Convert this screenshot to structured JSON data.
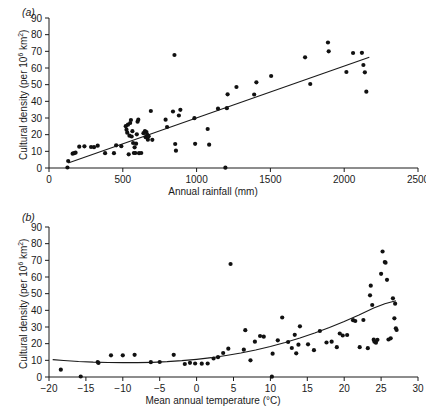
{
  "figure": {
    "panels": [
      {
        "label": "(a)",
        "xlabel": "Annual rainfall (mm)",
        "ylabel_prefix": "Cultural density (per 10",
        "ylabel_exp": "6",
        "ylabel_suffix": " km",
        "ylabel_suffix2": "2",
        "ylabel_close": ")"
      },
      {
        "label": "(b)",
        "xlabel": "Mean annual temperature (°C)",
        "ylabel_prefix": "Cultural density (per 10",
        "ylabel_exp": "6",
        "ylabel_suffix": " km",
        "ylabel_suffix2": "2",
        "ylabel_close": ")"
      }
    ]
  },
  "chart_data": [
    {
      "type": "scatter",
      "panel": "(a)",
      "title": "",
      "xlabel": "Annual rainfall (mm)",
      "ylabel": "Cultural density (per 10^6 km^2)",
      "xlim": [
        0,
        2500
      ],
      "ylim": [
        0,
        90
      ],
      "xticks": [
        0,
        500,
        1000,
        1500,
        2000,
        2500
      ],
      "yticks": [
        0,
        10,
        20,
        30,
        40,
        50,
        60,
        70,
        80,
        90
      ],
      "grid": false,
      "legend": "none",
      "marker": "filled-circle",
      "marker_color": "#111111",
      "fit": {
        "kind": "linear",
        "color": "#1a1a1a",
        "x_start": 130,
        "y_start": 3.0,
        "x_end": 2170,
        "y_end": 66.5
      },
      "points": [
        [
          125,
          0.3
        ],
        [
          130,
          4.2
        ],
        [
          160,
          8.6
        ],
        [
          170,
          8.9
        ],
        [
          180,
          9.2
        ],
        [
          205,
          12.8
        ],
        [
          240,
          13.0
        ],
        [
          285,
          12.6
        ],
        [
          305,
          12.5
        ],
        [
          330,
          13.4
        ],
        [
          380,
          8.9
        ],
        [
          440,
          8.9
        ],
        [
          455,
          13.6
        ],
        [
          490,
          13.1
        ],
        [
          520,
          25.1
        ],
        [
          525,
          23.0
        ],
        [
          530,
          21.2
        ],
        [
          535,
          26.0
        ],
        [
          540,
          8.2
        ],
        [
          545,
          19.4
        ],
        [
          550,
          27.0
        ],
        [
          555,
          28.8
        ],
        [
          560,
          18.9
        ],
        [
          565,
          22.1
        ],
        [
          570,
          15.0
        ],
        [
          575,
          9.0
        ],
        [
          580,
          12.4
        ],
        [
          585,
          9.0
        ],
        [
          590,
          14.6
        ],
        [
          595,
          20.2
        ],
        [
          600,
          27.8
        ],
        [
          605,
          29.0
        ],
        [
          610,
          8.9
        ],
        [
          625,
          9.0
        ],
        [
          640,
          20.9
        ],
        [
          650,
          22.2
        ],
        [
          655,
          18.5
        ],
        [
          660,
          21.6
        ],
        [
          665,
          20.0
        ],
        [
          670,
          17.0
        ],
        [
          675,
          19.0
        ],
        [
          690,
          34.2
        ],
        [
          700,
          16.9
        ],
        [
          790,
          29.0
        ],
        [
          800,
          24.6
        ],
        [
          840,
          33.9
        ],
        [
          850,
          67.8
        ],
        [
          855,
          14.4
        ],
        [
          860,
          10.4
        ],
        [
          880,
          31.5
        ],
        [
          890,
          34.9
        ],
        [
          985,
          29.9
        ],
        [
          990,
          14.5
        ],
        [
          1075,
          23.4
        ],
        [
          1085,
          14.0
        ],
        [
          1145,
          35.6
        ],
        [
          1195,
          0.2
        ],
        [
          1205,
          35.9
        ],
        [
          1210,
          44.2
        ],
        [
          1270,
          48.6
        ],
        [
          1390,
          44.1
        ],
        [
          1405,
          51.4
        ],
        [
          1505,
          55.2
        ],
        [
          1735,
          66.4
        ],
        [
          1770,
          50.4
        ],
        [
          1890,
          75.3
        ],
        [
          1895,
          70.0
        ],
        [
          2015,
          57.6
        ],
        [
          2060,
          69.0
        ],
        [
          2120,
          69.1
        ],
        [
          2130,
          61.8
        ],
        [
          2140,
          57.4
        ],
        [
          2150,
          45.8
        ]
      ]
    },
    {
      "type": "scatter",
      "panel": "(b)",
      "title": "",
      "xlabel": "Mean annual temperature (°C)",
      "ylabel": "Cultural density (per 10^6 km^2)",
      "xlim": [
        -20,
        30
      ],
      "ylim": [
        0,
        90
      ],
      "xticks": [
        -20,
        -15,
        -10,
        -5,
        0,
        5,
        10,
        15,
        20,
        25,
        30
      ],
      "yticks": [
        0,
        10,
        20,
        30,
        40,
        50,
        60,
        70,
        80,
        90
      ],
      "grid": false,
      "legend": "none",
      "marker": "filled-circle",
      "marker_color": "#111111",
      "fit": {
        "kind": "exponential-curve",
        "color": "#1a1a1a",
        "points": [
          [
            -19.5,
            10.4
          ],
          [
            -18,
            9.9
          ],
          [
            -16,
            9.3
          ],
          [
            -14,
            8.9
          ],
          [
            -12,
            8.7
          ],
          [
            -10,
            8.6
          ],
          [
            -8,
            8.6
          ],
          [
            -6,
            8.8
          ],
          [
            -4,
            9.2
          ],
          [
            -2,
            9.8
          ],
          [
            0,
            10.6
          ],
          [
            2,
            11.6
          ],
          [
            4,
            12.9
          ],
          [
            6,
            14.4
          ],
          [
            8,
            16.2
          ],
          [
            10,
            18.3
          ],
          [
            12,
            20.7
          ],
          [
            14,
            23.4
          ],
          [
            16,
            26.4
          ],
          [
            18,
            29.7
          ],
          [
            20,
            33.3
          ],
          [
            22,
            37.2
          ],
          [
            24,
            41.4
          ],
          [
            25.5,
            44.0
          ],
          [
            27,
            45.7
          ]
        ]
      },
      "points": [
        [
          -18.4,
          4.4
        ],
        [
          -15.7,
          0.3
        ],
        [
          -13.4,
          9.0
        ],
        [
          -13.3,
          8.4
        ],
        [
          -11.6,
          13.0
        ],
        [
          -10.0,
          13.0
        ],
        [
          -8.4,
          13.3
        ],
        [
          -6.2,
          8.9
        ],
        [
          -5.0,
          9.0
        ],
        [
          -3.1,
          13.3
        ],
        [
          -1.6,
          7.8
        ],
        [
          -0.9,
          8.5
        ],
        [
          -0.2,
          8.1
        ],
        [
          0.7,
          8.0
        ],
        [
          1.5,
          8.1
        ],
        [
          2.3,
          11.1
        ],
        [
          2.9,
          11.9
        ],
        [
          3.6,
          14.4
        ],
        [
          4.3,
          17.0
        ],
        [
          4.6,
          67.8
        ],
        [
          6.4,
          16.4
        ],
        [
          6.6,
          28.1
        ],
        [
          7.3,
          10.0
        ],
        [
          7.9,
          21.2
        ],
        [
          8.6,
          24.6
        ],
        [
          9.1,
          24.2
        ],
        [
          10.2,
          0.2
        ],
        [
          10.3,
          14.0
        ],
        [
          11.0,
          22.0
        ],
        [
          11.6,
          35.7
        ],
        [
          12.4,
          21.0
        ],
        [
          12.9,
          17.4
        ],
        [
          13.3,
          25.3
        ],
        [
          13.5,
          14.2
        ],
        [
          13.8,
          19.4
        ],
        [
          14.0,
          30.4
        ],
        [
          15.1,
          19.6
        ],
        [
          15.9,
          16.1
        ],
        [
          16.7,
          27.6
        ],
        [
          17.6,
          20.7
        ],
        [
          18.3,
          21.2
        ],
        [
          19.0,
          17.9
        ],
        [
          19.4,
          26.1
        ],
        [
          19.8,
          24.9
        ],
        [
          20.4,
          25.2
        ],
        [
          21.2,
          34.1
        ],
        [
          21.5,
          33.6
        ],
        [
          22.1,
          17.9
        ],
        [
          22.6,
          34.2
        ],
        [
          23.2,
          17.3
        ],
        [
          23.5,
          49.0
        ],
        [
          23.6,
          54.8
        ],
        [
          23.8,
          43.2
        ],
        [
          24.0,
          22.4
        ],
        [
          24.1,
          21.2
        ],
        [
          24.3,
          20.6
        ],
        [
          24.5,
          22.3
        ],
        [
          25.0,
          61.9
        ],
        [
          25.2,
          75.3
        ],
        [
          25.5,
          69.0
        ],
        [
          25.6,
          68.6
        ],
        [
          25.8,
          58.3
        ],
        [
          26.0,
          22.5
        ],
        [
          26.3,
          23.2
        ],
        [
          26.6,
          47.2
        ],
        [
          26.8,
          35.2
        ],
        [
          26.9,
          44.0
        ],
        [
          27.0,
          29.2
        ],
        [
          27.1,
          28.2
        ]
      ]
    }
  ]
}
